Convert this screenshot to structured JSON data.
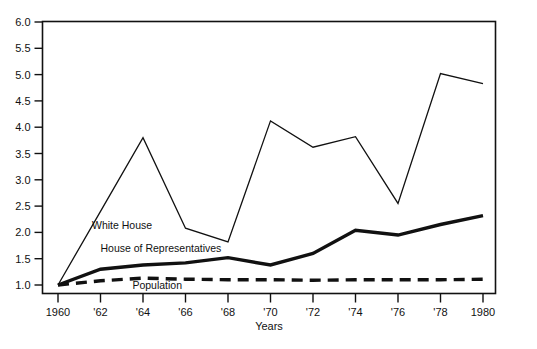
{
  "chart_data": {
    "type": "line",
    "title": "",
    "subtitle": "",
    "xlabel": "Years",
    "ylabel": "",
    "x": [
      1960,
      1961,
      1962,
      1963,
      1964,
      1965,
      1966,
      1967,
      1968,
      1969,
      1970,
      1971,
      1972,
      1973,
      1974,
      1975,
      1976,
      1977,
      1978,
      1979,
      1980
    ],
    "categories": [
      "1960",
      "'62",
      "'64",
      "'66",
      "'68",
      "'70",
      "'72",
      "'74",
      "'76",
      "'78",
      "1980"
    ],
    "xtick_values": [
      1960,
      1962,
      1964,
      1966,
      1968,
      1970,
      1972,
      1974,
      1976,
      1978,
      1980
    ],
    "ytick_labels": [
      "1.0",
      "1.5",
      "2.0",
      "2.5",
      "3.0",
      "3.5",
      "4.0",
      "4.5",
      "5.0",
      "5.5",
      "6.0"
    ],
    "ytick_values": [
      1.0,
      1.5,
      2.0,
      2.5,
      3.0,
      3.5,
      4.0,
      4.5,
      5.0,
      5.5,
      6.0
    ],
    "xlim": [
      1960,
      1980
    ],
    "ylim": [
      1.0,
      6.0
    ],
    "grid": false,
    "legend_position": "inline-annotations",
    "series": [
      {
        "name": "White House",
        "style": "thin-solid",
        "color": "#111111",
        "x": [
          1960,
          1962,
          1964,
          1966,
          1968,
          1970,
          1972,
          1974,
          1976,
          1978,
          1980
        ],
        "values": [
          1.0,
          2.4,
          3.8,
          2.08,
          1.82,
          4.12,
          3.62,
          3.82,
          2.55,
          5.02,
          4.83
        ],
        "label_position": {
          "x": 1961.6,
          "y": 2.07
        }
      },
      {
        "name": "House of Representatives",
        "style": "thick-solid",
        "color": "#111111",
        "x": [
          1960,
          1962,
          1964,
          1966,
          1968,
          1970,
          1972,
          1974,
          1976,
          1978,
          1980
        ],
        "values": [
          1.0,
          1.3,
          1.38,
          1.42,
          1.52,
          1.38,
          1.6,
          2.04,
          1.95,
          2.15,
          2.32
        ],
        "label_position": {
          "x": 1962.0,
          "y": 1.62
        }
      },
      {
        "name": "Population",
        "style": "thick-dashed",
        "color": "#111111",
        "x": [
          1960,
          1962,
          1964,
          1966,
          1968,
          1970,
          1972,
          1974,
          1976,
          1978,
          1980
        ],
        "values": [
          1.0,
          1.08,
          1.13,
          1.11,
          1.1,
          1.1,
          1.09,
          1.1,
          1.1,
          1.1,
          1.11
        ],
        "label_position": {
          "x": 1963.5,
          "y": 0.92
        }
      }
    ]
  },
  "axes": {
    "x_axis_title": "Years"
  },
  "colors": {
    "line": "#111111",
    "frame": "#111111",
    "background": "#ffffff"
  }
}
